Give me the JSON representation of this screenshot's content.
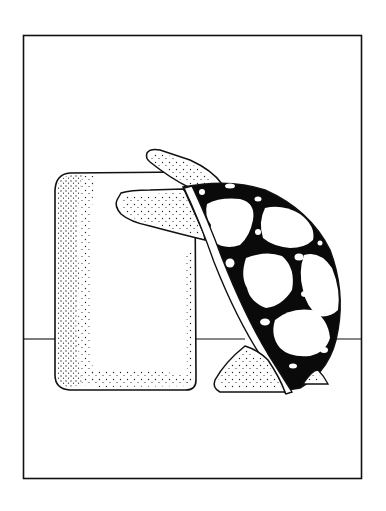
{
  "image": {
    "description": "Black-and-white stippled line illustration of a tortoise climbing over a rectangular stone block, inside a rectangular frame",
    "colors": {
      "background": "#ffffff",
      "ink": "#111111",
      "shell": "#0a0a0a"
    },
    "elements": [
      "frame",
      "ground-line",
      "stone-block",
      "tortoise-head",
      "tortoise-front-leg",
      "tortoise-shell",
      "tortoise-plastron",
      "tortoise-rear-leg",
      "tortoise-tail"
    ]
  }
}
